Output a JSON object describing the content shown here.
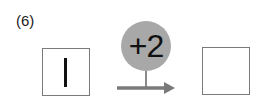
{
  "problem": {
    "number_label": "(6)",
    "start_value": "1",
    "operation": "+2",
    "result_value": ""
  },
  "colors": {
    "circle_fill": "#a8a8a8",
    "arrow": "#7a7a7a",
    "box_border": "#7a7a7a"
  }
}
